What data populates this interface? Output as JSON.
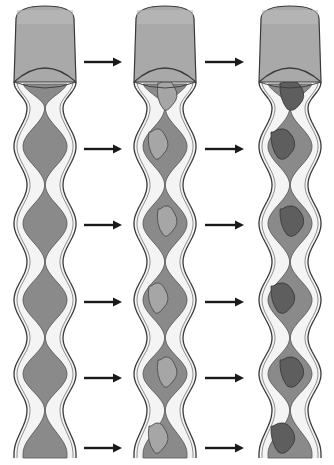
{
  "diagram": {
    "colors": {
      "cap": "#a9a9a9",
      "cap_top": "#bdbdbd",
      "wall": "#f4f4f4",
      "outline": "#3a3a3a",
      "lumen": "#8a8a8a",
      "lumen_light": "#a6a6a6",
      "mix_dark": "#5e5e5e",
      "arrow": "#1a1a1a"
    },
    "tubes": [
      {
        "name": "stage-1",
        "cx": 45,
        "mixing": "none"
      },
      {
        "name": "stage-2",
        "cx": 165,
        "mixing": "partial"
      },
      {
        "name": "stage-3",
        "cx": 290,
        "mixing": "full"
      }
    ],
    "tube_top": 60,
    "tube_bottom": 458,
    "constrictions_y": [
      108,
      185,
      262,
      338,
      410
    ],
    "arrow_rows_y": [
      62,
      149,
      225,
      302,
      378,
      448
    ],
    "arrow_columns": [
      {
        "x1": 84,
        "x2": 122
      },
      {
        "x1": 205,
        "x2": 244
      }
    ]
  }
}
